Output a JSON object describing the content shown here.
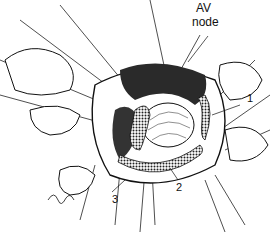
{
  "figure": {
    "type": "surgical line illustration",
    "labels": {
      "av_node_line1": "AV",
      "av_node_line2": "node",
      "l1": "1",
      "l2": "2",
      "l3": "3"
    }
  }
}
